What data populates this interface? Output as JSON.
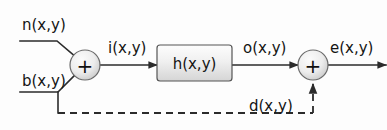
{
  "diagram": {
    "type": "signal-flow-block-diagram",
    "background_color": "#fdfdfd",
    "line_color": "#2b2b2b",
    "text_color": "#141414",
    "block_fill_top": "#fdfdfd",
    "block_fill_bottom": "#d9d9d9",
    "summer_fill": "#f2f2f2",
    "summer_shade": "#c9c9c9"
  },
  "labels": {
    "noise_input": "n(x,y)",
    "blur_input": "b(x,y)",
    "intermediate": "i(x,y)",
    "system_block": "h(x,y)",
    "output": "o(x,y)",
    "feedback": "d(x,y)",
    "error_output": "e(x,y)",
    "summer_symbol_1": "+",
    "summer_symbol_2": "+"
  },
  "nodes": [
    {
      "id": "summer-1",
      "kind": "summing-junction",
      "symbol": "+",
      "cx": 85,
      "cy": 65,
      "r": 15
    },
    {
      "id": "block-h",
      "kind": "transfer-block",
      "label": "h(x,y)",
      "x": 157,
      "y": 45,
      "width": 75,
      "height": 36
    },
    {
      "id": "summer-2",
      "kind": "summing-junction",
      "symbol": "+",
      "cx": 313,
      "cy": 65,
      "r": 15
    }
  ],
  "edges": [
    {
      "id": "edge-n-to-summer1",
      "from": "n(x,y)",
      "to": "summer-1",
      "style": "solid",
      "arrow": false
    },
    {
      "id": "edge-b-to-summer1",
      "from": "b(x,y)",
      "to": "summer-1",
      "style": "solid",
      "arrow": false
    },
    {
      "id": "edge-summer1-to-block",
      "from": "summer-1",
      "to": "block-h",
      "label": "i(x,y)",
      "style": "solid",
      "arrow": true
    },
    {
      "id": "edge-block-to-summer2",
      "from": "block-h",
      "to": "summer-2",
      "label": "o(x,y)",
      "style": "solid",
      "arrow": true
    },
    {
      "id": "edge-summer2-to-output",
      "from": "summer-2",
      "to": "e(x,y)",
      "label": "e(x,y)",
      "style": "solid",
      "arrow": true
    },
    {
      "id": "edge-feedback",
      "from": "b(x,y) branch",
      "to": "summer-2",
      "label": "d(x,y)",
      "style": "dashed",
      "arrow": true
    }
  ]
}
